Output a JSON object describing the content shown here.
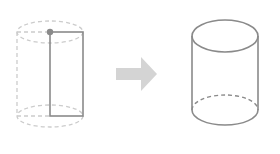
{
  "diagram": {
    "colors": {
      "solid_stroke": "#8a8a8a",
      "dashed_stroke": "#c8c8c8",
      "arrow_fill": "#d4d4d4",
      "axis_dot": "#8a8a8a"
    },
    "left_figure": {
      "label": "rectangle with rotation axis",
      "shape": "rectangle"
    },
    "arrow": {
      "direction": "right"
    },
    "right_figure": {
      "label": "cylinder",
      "shape": "cylinder"
    }
  }
}
